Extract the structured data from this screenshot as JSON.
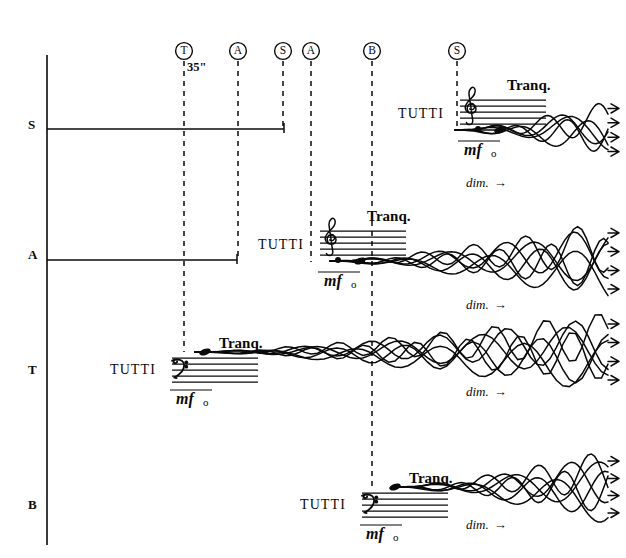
{
  "page": {
    "width": 626,
    "height": 558,
    "background": "#ffffff",
    "ink": "#0a0a0a"
  },
  "chart_data": {
    "type": "table",
    "xlabel": "",
    "ylabel": "",
    "grid": false,
    "legend": "none",
    "axis": {
      "vertical_line_x": 47,
      "vertical_line_y_top": 55,
      "vertical_line_y_bottom": 545
    },
    "voices": [
      {
        "label": "S",
        "label_x": 28,
        "label_y": 125,
        "baseline_y": 129,
        "lead_line": {
          "x_start": 47,
          "x_end": 284,
          "end_tick": true
        },
        "entry_x": 398,
        "clef": "treble",
        "tutti": "TUTTI",
        "tempo_mark": "Tranq.",
        "dynamic": "mf",
        "vowel": "o",
        "dim": "dim.",
        "dim_x": 466,
        "dim_y": 176,
        "cluster_start_x": 455,
        "cluster_end_x": 618,
        "cluster_strands": 5,
        "cluster_max_spread": 20
      },
      {
        "label": "A",
        "label_x": 28,
        "label_y": 255,
        "baseline_y": 260,
        "lead_line": {
          "x_start": 47,
          "x_end": 237,
          "end_tick": true
        },
        "entry_x": 258,
        "clef": "treble",
        "tutti": "TUTTI",
        "tempo_mark": "Tranq.",
        "dynamic": "mf",
        "vowel": "o",
        "dim": "dim.",
        "dim_x": 466,
        "dim_y": 298,
        "cluster_start_x": 330,
        "cluster_end_x": 618,
        "cluster_strands": 6,
        "cluster_max_spread": 26
      },
      {
        "label": "T",
        "label_x": 28,
        "label_y": 370,
        "baseline_y": 352,
        "lead_line": null,
        "entry_x": 110,
        "clef": "bass",
        "tutti": "TUTTI",
        "tempo_mark": "Tranq.",
        "dynamic": "mf",
        "vowel": "o",
        "dim": "dim.",
        "dim_x": 466,
        "dim_y": 385,
        "cluster_start_x": 195,
        "cluster_end_x": 618,
        "cluster_strands": 6,
        "cluster_max_spread": 26
      },
      {
        "label": "B",
        "label_x": 28,
        "label_y": 505,
        "baseline_y": 487,
        "lead_line": null,
        "entry_x": 300,
        "clef": "bass",
        "tutti": "TUTTI",
        "tempo_mark": "Tranq.",
        "dynamic": "mf",
        "vowel": "o",
        "dim": "dim.",
        "dim_x": 466,
        "dim_y": 518,
        "cluster_start_x": 395,
        "cluster_end_x": 618,
        "cluster_strands": 6,
        "cluster_max_spread": 24
      }
    ],
    "cues": [
      {
        "letter": "T",
        "x": 184,
        "circle_y": 51,
        "dash_y_end": 352,
        "duration_label": "35\""
      },
      {
        "letter": "A",
        "x": 238,
        "circle_y": 51,
        "dash_y_end": 260,
        "duration_label": ""
      },
      {
        "letter": "S",
        "x": 283,
        "circle_y": 51,
        "dash_y_end": 129,
        "duration_label": ""
      },
      {
        "letter": "A",
        "x": 311,
        "circle_y": 51,
        "dash_y_end": 262,
        "duration_label": ""
      },
      {
        "letter": "B",
        "x": 372,
        "circle_y": 51,
        "dash_y_end": 487,
        "duration_label": ""
      },
      {
        "letter": "S",
        "x": 457,
        "circle_y": 51,
        "dash_y_end": 131,
        "duration_label": ""
      }
    ]
  }
}
